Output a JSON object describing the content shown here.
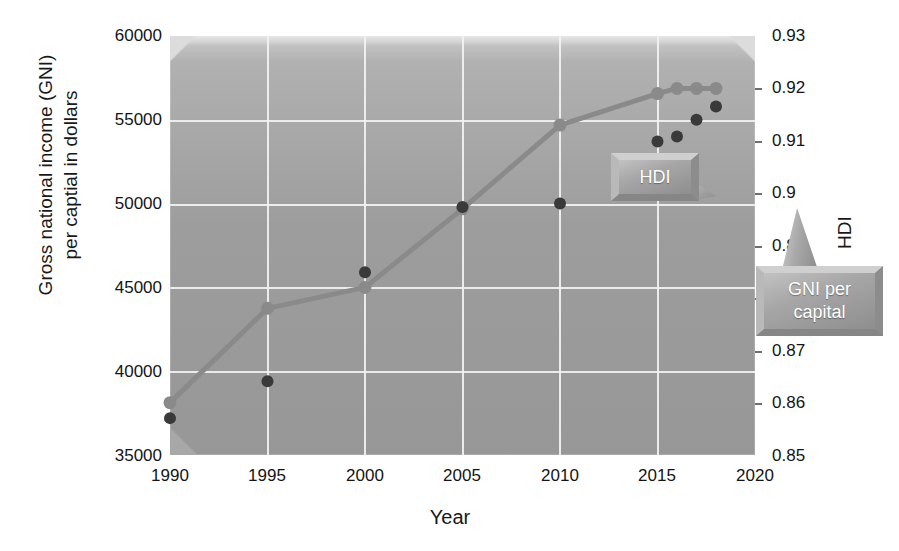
{
  "chart_data": {
    "type": "line",
    "title": "",
    "xlabel": "Year",
    "ylabel_left": "Gross national income (GNI)\nper captial in dollars",
    "ylabel_right": "HDI",
    "x": [
      1990,
      1995,
      2000,
      2005,
      2010,
      2015,
      2016,
      2017,
      2018
    ],
    "xlim": [
      1990,
      2020
    ],
    "xticks": [
      "1990",
      "1995",
      "2000",
      "2005",
      "2010",
      "2015",
      "2020"
    ],
    "xtick_values": [
      1990,
      1995,
      2000,
      2005,
      2010,
      2015,
      2020
    ],
    "ylim_left": [
      35000,
      60000
    ],
    "yticks_left": [
      "35000",
      "40000",
      "45000",
      "50000",
      "55000",
      "60000"
    ],
    "ytick_values_left": [
      35000,
      40000,
      45000,
      50000,
      55000,
      60000
    ],
    "ylim_right": [
      0.85,
      0.93
    ],
    "yticks_right": [
      "0.85",
      "0.86",
      "0.87",
      "0.88",
      "0.89",
      "0.9",
      "0.91",
      "0.92",
      "0.93"
    ],
    "ytick_values_right": [
      0.85,
      0.86,
      0.87,
      0.88,
      0.89,
      0.9,
      0.91,
      0.92,
      0.93
    ],
    "grid": true,
    "legend_position": "none",
    "series": [
      {
        "name": "GNI per capital",
        "axis": "left",
        "style": "scatter",
        "color": "#3a3a3a",
        "values": [
          37200,
          39400,
          45900,
          49800,
          50000,
          53700,
          54000,
          55000,
          55800
        ]
      },
      {
        "name": "HDI",
        "axis": "right",
        "style": "line-marker",
        "color": "#8a8a8a",
        "values": [
          0.86,
          0.878,
          0.882,
          0.897,
          0.913,
          0.919,
          0.92,
          0.92,
          0.92
        ]
      }
    ],
    "annotations": [
      {
        "label": "HDI",
        "target_series": "HDI"
      },
      {
        "label": "GNI per\ncapital",
        "target_series": "GNI per capital"
      }
    ]
  },
  "axes": {
    "x_title": "Year",
    "y_left_title": "Gross national income (GNI)\nper captial in dollars",
    "y_right_title": "HDI",
    "x_ticks": [
      "1990",
      "1995",
      "2000",
      "2005",
      "2010",
      "2015",
      "2020"
    ],
    "y_left_ticks": [
      "60000",
      "55000",
      "50000",
      "45000",
      "40000",
      "35000"
    ],
    "y_right_ticks": [
      "0.93",
      "0.92",
      "0.91",
      "0.9",
      "0.89",
      "0.88",
      "0.87",
      "0.86",
      "0.85"
    ]
  },
  "callouts": {
    "hdi": "HDI",
    "gni_line1": "GNI per",
    "gni_line2": "capital"
  },
  "colors": {
    "plot_background": "#9d9d9d",
    "gridline": "#f2f2f2",
    "gni_marker": "#3a3a3a",
    "hdi_line": "#8a8a8a",
    "text": "#141414",
    "callout_text": "#ffffff"
  }
}
